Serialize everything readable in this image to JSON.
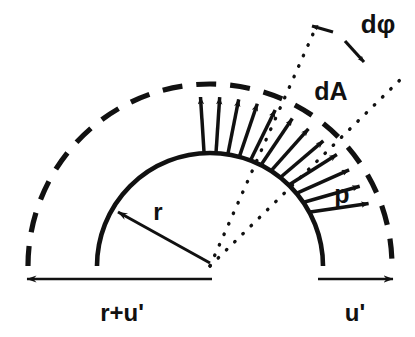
{
  "figure": {
    "background_color": "#ffffff",
    "ink_color": "#111111",
    "width": 415,
    "height": 337,
    "geometry": {
      "center_x": 210,
      "center_y": 266,
      "inner_radius": 113,
      "outer_radius": 182,
      "sector_start_deg": 56,
      "sector_end_deg": 93
    },
    "labels": {
      "radius": "r",
      "area_element": "dA",
      "angle_element": "dφ",
      "pressure": "p",
      "left_dimension": "r+u'",
      "right_dimension": "u'"
    },
    "curves": {
      "inner_arc_style": "solid",
      "outer_arc_style": "dashed",
      "sector_edges_style": "dotted"
    },
    "arrows": {
      "radial_count": 12,
      "radial_description": "outward pressure arrows from inner arc to outer dashed arc",
      "angle_arc_heads": 2,
      "baseline_left_direction": "left",
      "baseline_right_direction": "right"
    }
  }
}
